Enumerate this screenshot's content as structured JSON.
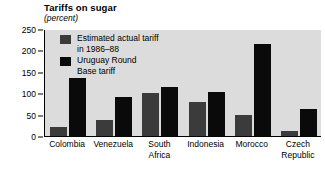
{
  "chart_data": {
    "type": "bar",
    "title": "Tariffs on sugar",
    "subtitle": "(percent)",
    "xlabel": "",
    "ylabel": "",
    "ylim": [
      0,
      250
    ],
    "yticks": [
      0,
      50,
      100,
      150,
      200,
      250
    ],
    "grid": false,
    "legend_position": "upper-left-inside",
    "categories": [
      "Colombia",
      "Venezuela",
      "South\nAfrica",
      "Indonesia",
      "Morocco",
      "Czech\nRepublic"
    ],
    "series": [
      {
        "name": "Estimated actual tariff\nin 1986–88",
        "color": "#3b3b3b",
        "values": [
          20,
          37,
          100,
          80,
          50,
          12
        ]
      },
      {
        "name": "Uruguay Round\nBase tariff",
        "color": "#0a0a0a",
        "values": [
          135,
          90,
          115,
          103,
          215,
          62
        ]
      }
    ]
  },
  "axis": {
    "ytick_labels": [
      "0",
      "50",
      "100",
      "150",
      "200",
      "250"
    ]
  },
  "legend": {
    "items": [
      {
        "label": "Estimated actual tariff\nin 1986–88",
        "swatch": "actual"
      },
      {
        "label": "Uruguay Round\nBase tariff",
        "swatch": "uruguay"
      }
    ]
  }
}
